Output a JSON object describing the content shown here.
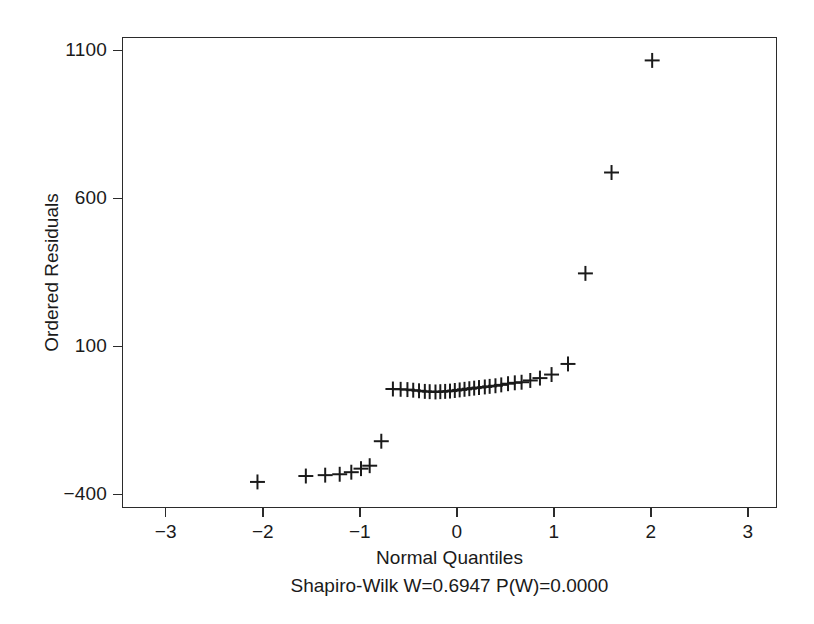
{
  "chart_data": {
    "type": "scatter",
    "title": "",
    "subtitle": "Shapiro-Wilk W=0.6947  P(W)=0.0000",
    "xlabel": "Normal Quantiles",
    "ylabel": "Ordered Residuals",
    "xlim": [
      -3.45,
      3.3
    ],
    "ylim": [
      -445,
      1145
    ],
    "xticks": [
      -3,
      -2,
      -1,
      0,
      1,
      2,
      3
    ],
    "xticklabels": [
      "−3",
      "−2",
      "−1",
      "0",
      "1",
      "2",
      "3"
    ],
    "yticks": [
      1100,
      600,
      100,
      -400
    ],
    "yticklabels": [
      "1100",
      "600",
      "100",
      "−400"
    ],
    "grid": false,
    "legend": null,
    "marker": "plus",
    "marker_color": "#1a1a1a",
    "frame_color": "#2b2b2b",
    "x": [
      -2.06,
      -1.56,
      -1.36,
      -1.21,
      -1.09,
      -0.99,
      -0.9,
      -0.78,
      -0.66,
      -0.58,
      -0.51,
      -0.45,
      -0.39,
      -0.33,
      -0.28,
      -0.22,
      -0.17,
      -0.12,
      -0.07,
      -0.02,
      0.03,
      0.08,
      0.13,
      0.18,
      0.23,
      0.29,
      0.34,
      0.4,
      0.46,
      0.53,
      0.6,
      0.67,
      0.76,
      0.86,
      0.98,
      1.15,
      1.33,
      1.6,
      2.02
    ],
    "y": [
      -360,
      -340,
      -337,
      -334,
      -327,
      -315,
      -305,
      -222,
      -45,
      -46,
      -47,
      -49,
      -51,
      -53,
      -54,
      -55,
      -54,
      -53,
      -52,
      -50,
      -48,
      -46,
      -44,
      -42,
      -40,
      -38,
      -36,
      -34,
      -31,
      -27,
      -24,
      -22,
      -16,
      -8,
      4,
      40,
      347,
      689,
      1069
    ]
  },
  "axes": {
    "y_tick_labels": [
      "1100",
      "600",
      "100",
      "−400"
    ],
    "x_tick_labels": [
      "−3",
      "−2",
      "−1",
      "0",
      "1",
      "2",
      "3"
    ],
    "y_title": "Ordered Residuals",
    "x_title": "Normal Quantiles"
  },
  "footnote": {
    "text": "Shapiro-Wilk W=0.6947  P(W)=0.0000"
  }
}
